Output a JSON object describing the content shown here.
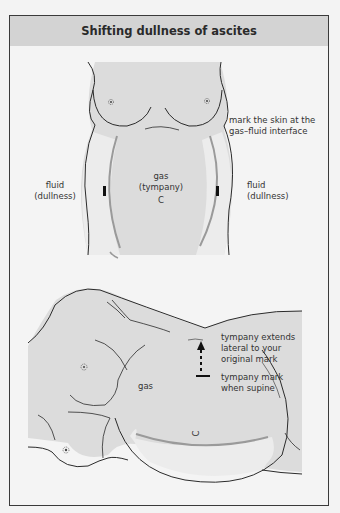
{
  "figure": {
    "title": "Shifting dullness of ascites"
  },
  "panel_supine": {
    "label_mark": [
      "mark the skin at the",
      "gas–fluid interface"
    ],
    "label_gas": [
      "gas",
      "(tympany)"
    ],
    "label_navel": "C",
    "label_fluid_left": [
      "fluid",
      "(dullness)"
    ],
    "label_fluid_right": [
      "fluid",
      "(dullness)"
    ]
  },
  "panel_lateral": {
    "label_extends": [
      "tympany extends",
      "lateral to your",
      "original mark"
    ],
    "label_supine_mark": [
      "tympany mark",
      "when supine"
    ],
    "label_gas": "gas",
    "label_navel": "C"
  },
  "colors": {
    "skin": "#dcdcdc",
    "fluid": "#ececec",
    "line": "#2b2b2b",
    "interface": "#9a9a9a",
    "header": "#d3d3d3"
  }
}
